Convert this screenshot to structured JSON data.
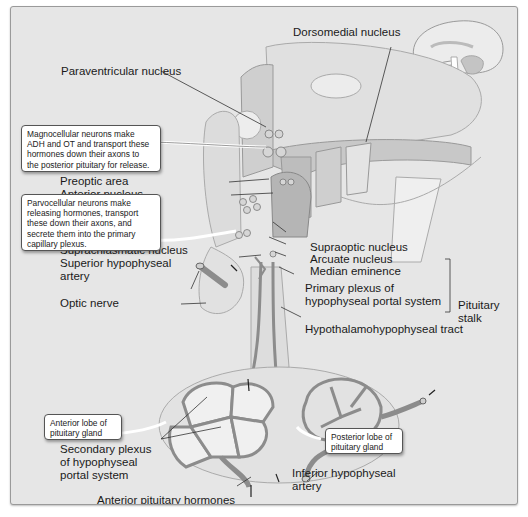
{
  "figure": {
    "colors": {
      "background": "#e6e6e6",
      "tissue_light": "#d9d9d9",
      "tissue_mid": "#bdbdbd",
      "vessel": "#8c8c8c",
      "text": "#1a1a1a"
    }
  },
  "labels": {
    "dorsomedial_nucleus": "Dorsomedial nucleus",
    "paraventricular_nucleus": "Paraventricular nucleus",
    "preoptic_area": "Preoptic area",
    "anterior_nucleus": "Anterior nucleus",
    "suprachiasmatic_nucleus": "Suprachiasmatic nucleus",
    "superior_hypophyseal_artery_1": "Superior hypophyseal",
    "superior_hypophyseal_artery_2": "artery",
    "optic_nerve": "Optic nerve",
    "supraoptic_nucleus": "Supraoptic nucleus",
    "arcuate_nucleus": "Arcuate nucleus",
    "median_eminence": "Median eminence",
    "primary_plexus_1": "Primary plexus of",
    "primary_plexus_2": "hypophyseal portal system",
    "pituitary_stalk_1": "Pituitary",
    "pituitary_stalk_2": "stalk",
    "hypothalamohypophyseal_tract": "Hypothalamohypophyseal tract",
    "secondary_plexus_1": "Secondary plexus",
    "secondary_plexus_2": "of hypophyseal",
    "secondary_plexus_3": "portal system",
    "anterior_pituitary_hormones": "Anterior pituitary hormones",
    "inferior_hypophyseal_artery_1": "Inferior hypophyseal",
    "inferior_hypophyseal_artery_2": "artery"
  },
  "callouts": {
    "magnocellular": [
      "Magnocellular neurons make",
      "ADH and OT and transport these",
      "hormones down their axons to",
      "the posterior pituitary for release."
    ],
    "parvocellular": [
      "Parvocellular neurons make",
      "releasing hormones, transport",
      "these down their axons, and",
      "secrete them into the primary",
      "capillary plexus."
    ],
    "anterior_lobe": [
      "Anterior lobe of",
      "pituitary gland"
    ],
    "posterior_lobe": [
      "Posterior lobe of",
      "pituitary gland"
    ]
  }
}
